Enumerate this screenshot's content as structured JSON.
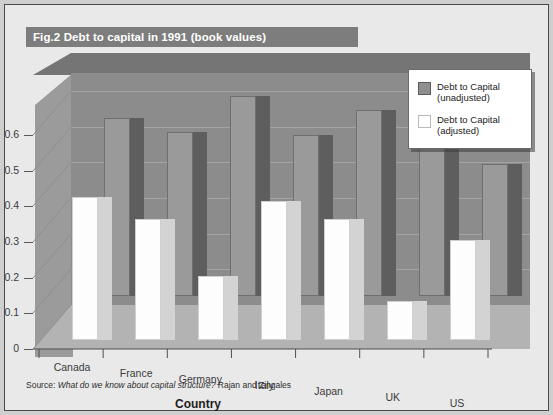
{
  "figure": {
    "label": "Fig.2",
    "title": "Debt to capital in 1991 (book values)",
    "title_full": "Fig.2 Debt to capital in 1991 (book values)"
  },
  "source": {
    "prefix": "Source:",
    "work": "What do we know about capital structure?",
    "authors": "Rajan and Zingales"
  },
  "legend": {
    "position": "top-right",
    "entries": [
      {
        "label_line1": "Debt to Capital",
        "label_line2": "(unadjusted)",
        "swatch": "gray-square-icon",
        "color": "#8f8f8f"
      },
      {
        "label_line1": "Debt to Capital",
        "label_line2": "(adjusted)",
        "swatch": "white-square-icon",
        "color": "#ffffff"
      }
    ]
  },
  "colors": {
    "frame_background": "#e9e9e9",
    "title_bar": "#7d7d7d",
    "title_text": "#ffffff",
    "back_wall": "#8c8c8c",
    "left_wall": "#9b9b9b",
    "floor": "#b3b3b3",
    "top_slab": "#757575",
    "bar_unadjusted": "#9a9a9a",
    "bar_adjusted": "#fdfdfd",
    "gridline": "#a8a8a8",
    "axis_text": "#3b3b3b"
  },
  "chart_data": {
    "type": "bar",
    "title": "Fig.2 Debt to capital in 1991 (book values)",
    "xlabel": "Country",
    "ylabel": "",
    "ylim": [
      0,
      0.65
    ],
    "yticks": [
      0,
      0.1,
      0.2,
      0.3,
      0.4,
      0.5,
      0.6
    ],
    "ytick_labels": [
      "0",
      "0.1",
      "0.2",
      "0.3",
      "0.4",
      "0.5",
      "0.6"
    ],
    "grid": true,
    "legend_position": "top-right",
    "three_d": true,
    "categories": [
      "Canada",
      "France",
      "Germany",
      "Italy",
      "Japan",
      "UK",
      "US"
    ],
    "series": [
      {
        "name": "Debt to Capital (unadjusted)",
        "color": "#9a9a9a",
        "values": [
          0.5,
          0.46,
          0.56,
          0.45,
          0.52,
          0.62,
          0.37
        ]
      },
      {
        "name": "Debt to Capital (adjusted)",
        "color": "#fdfdfd",
        "values": [
          0.4,
          0.34,
          0.18,
          0.39,
          0.34,
          0.11,
          0.28
        ]
      }
    ]
  }
}
